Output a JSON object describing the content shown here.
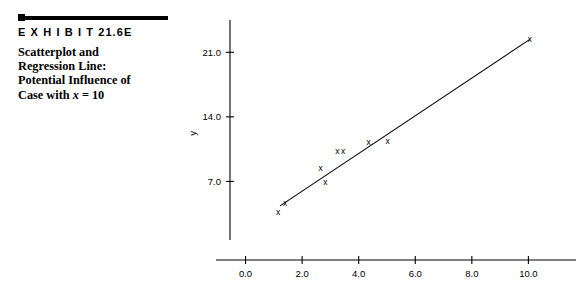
{
  "exhibit": {
    "label": "E X H I B I T  21.6E",
    "caption_line1": "Scatterplot and",
    "caption_line2": "Regression Line:",
    "caption_line3": "Potential Influence of",
    "caption_line4_pre": "Case with ",
    "caption_line4_ital": "x",
    "caption_line4_post": " = 10"
  },
  "chart_data": {
    "type": "scatter",
    "title": "",
    "xlabel": "x",
    "ylabel": "y",
    "xlim": [
      -0.55,
      11.4
    ],
    "ylim": [
      0.0,
      24.5
    ],
    "xticks": [
      "0.0",
      "2.0",
      "4.0",
      "6.0",
      "8.0",
      "10.0"
    ],
    "xtick_values": [
      0.0,
      2.0,
      4.0,
      6.0,
      8.0,
      10.0
    ],
    "yticks": [
      "7.0",
      "14.0",
      "21.0"
    ],
    "ytick_values": [
      7.0,
      14.0,
      21.0
    ],
    "grid": false,
    "legend": "none",
    "marker": "x",
    "points": [
      {
        "x": 1.15,
        "y": 3.7
      },
      {
        "x": 1.4,
        "y": 4.65
      },
      {
        "x": 2.65,
        "y": 8.5
      },
      {
        "x": 2.82,
        "y": 6.95
      },
      {
        "x": 3.25,
        "y": 10.25
      },
      {
        "x": 3.45,
        "y": 10.3
      },
      {
        "x": 4.35,
        "y": 11.25
      },
      {
        "x": 5.02,
        "y": 11.35
      },
      {
        "x": 10.05,
        "y": 22.4
      }
    ],
    "regression_line": {
      "x_start": 1.22,
      "y_start": 4.35,
      "x_end": 10.05,
      "y_end": 22.4,
      "label": "Regression Line"
    },
    "annotations": []
  }
}
